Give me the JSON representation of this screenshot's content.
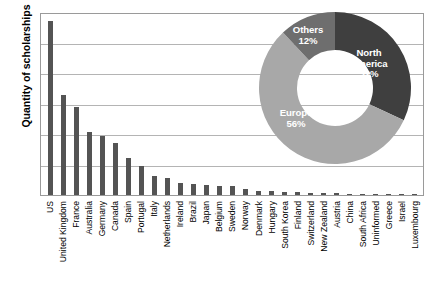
{
  "chart_data": {
    "type": "bar",
    "title": "",
    "xlabel": "",
    "ylabel": "Quantity of scholarships",
    "ylim": [
      0,
      600
    ],
    "ytick_step": 100,
    "yticks": [
      0,
      100,
      200,
      300,
      400,
      500,
      600
    ],
    "grid": true,
    "legend": "none",
    "bar_color": "#545454",
    "categories": [
      "US",
      "United Kingdom",
      "France",
      "Australia",
      "Germany",
      "Canada",
      "Spain",
      "Portugal",
      "Italy",
      "Netherlands",
      "Ireland",
      "Brazil",
      "Japan",
      "Belgium",
      "Sweden",
      "Norway",
      "Denmark",
      "Hungary",
      "South Korea",
      "Finland",
      "Switzerland",
      "New Zealand",
      "Austria",
      "China",
      "South Africa",
      "Uninformed",
      "Greece",
      "Israel",
      "Luxembourg"
    ],
    "values": [
      570,
      328,
      290,
      208,
      192,
      172,
      123,
      96,
      62,
      56,
      40,
      35,
      32,
      30,
      28,
      20,
      14,
      12,
      11,
      9,
      8,
      7,
      5,
      4,
      4,
      3,
      3,
      2,
      2
    ]
  },
  "inset_chart": {
    "type": "pie",
    "variant": "donut",
    "title": "",
    "slices": [
      {
        "label": "North America",
        "value": 32,
        "display": "North\nAmerica\n32%",
        "color": "#3f3f3f"
      },
      {
        "label": "Europe",
        "value": 56,
        "display": "Europe\n56%",
        "color": "#a8a8a8"
      },
      {
        "label": "Others",
        "value": 12,
        "display": "Others\n12%",
        "color": "#6e6e6e"
      }
    ],
    "unit": "%"
  }
}
